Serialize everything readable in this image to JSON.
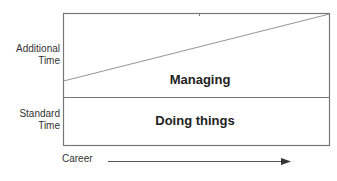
{
  "diagram": {
    "y_axis": {
      "upper_label": "Additional\nTime",
      "upper_label_lines": [
        "Additional",
        "Time"
      ],
      "lower_label_lines": [
        "Standard",
        "Time"
      ]
    },
    "regions": {
      "upper": "Managing",
      "lower": "Doing things"
    },
    "x_axis": {
      "label": "Career",
      "arrow_direction": "right"
    },
    "colors": {
      "line": "#777777",
      "text": "#222222",
      "background": "#ffffff"
    }
  }
}
